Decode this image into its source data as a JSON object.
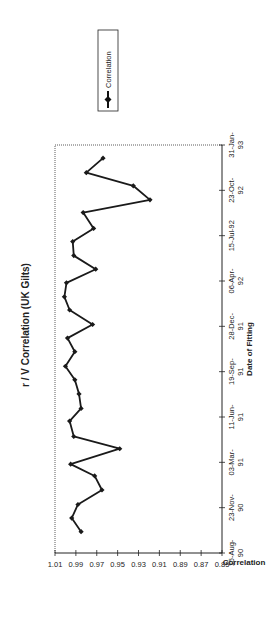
{
  "chart_data": {
    "type": "line",
    "orientation": "rotated-90-ccw",
    "title": "r / V Correlation (UK Gilts)",
    "xlabel": "Date of Fitting",
    "ylabel": "Correlation",
    "ylim": [
      0.85,
      1.01
    ],
    "yticks": [
      "1.01",
      "0.99",
      "0.97",
      "0.95",
      "0.93",
      "0.91",
      "0.89",
      "0.87",
      "0.85"
    ],
    "xticks": [
      {
        "line1": "15-Aug-",
        "line2": "90"
      },
      {
        "line1": "23-Nov-",
        "line2": "90"
      },
      {
        "line1": "03-Mar-",
        "line2": "91"
      },
      {
        "line1": "11-Jun-",
        "line2": "91"
      },
      {
        "line1": "19-Sep-",
        "line2": "91"
      },
      {
        "line1": "28-Dec-",
        "line2": "91"
      },
      {
        "line1": "06-Apr-",
        "line2": "92"
      },
      {
        "line1": "15-Jul-92",
        "line2": ""
      },
      {
        "line1": "23-Oct-",
        "line2": "92"
      },
      {
        "line1": "31-Jan-",
        "line2": "93"
      }
    ],
    "x_range_days": [
      0,
      900
    ],
    "grid": false,
    "legend": {
      "position": "top-right",
      "entries": [
        "Correlation"
      ]
    },
    "series": [
      {
        "name": "Correlation",
        "marker": "diamond",
        "color": "#1a1a1a",
        "x_days": [
          47,
          77,
          107,
          139,
          170,
          196,
          230,
          257,
          291,
          319,
          351,
          382,
          412,
          444,
          474,
          504,
          536,
          565,
          596,
          626,
          656,
          687,
          716,
          751,
          779,
          810,
          839,
          871
        ],
        "x": [
          "Oct-90",
          "Oct-90",
          "Nov-90",
          "Jan-91",
          "Feb-91",
          "Feb-91",
          "Apr-91",
          "Apr-91",
          "Jun-91",
          "Jun-91",
          "Jul-91",
          "Aug-91",
          "Sep-91",
          "Oct-91",
          "Nov-91",
          "Dec-91",
          "Jan-92",
          "Feb-92",
          "Mar-92",
          "Apr-92",
          "May-92",
          "Jun-92",
          "Jul-92",
          "Aug-92",
          "Sep-92",
          "Oct-92",
          "Nov-92",
          "Dec-92"
        ],
        "values": [
          0.985,
          0.994,
          0.988,
          0.965,
          0.972,
          0.995,
          0.948,
          0.992,
          0.996,
          0.985,
          0.987,
          0.991,
          1.0,
          0.991,
          0.998,
          0.974,
          0.996,
          1.001,
          0.999,
          0.971,
          0.992,
          0.993,
          0.973,
          0.983,
          0.919,
          0.935,
          0.98,
          0.964
        ]
      }
    ]
  }
}
